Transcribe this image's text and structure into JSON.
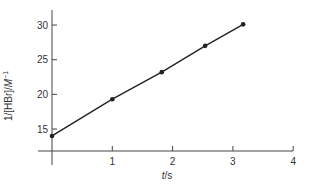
{
  "chart_data": {
    "type": "line",
    "title": "",
    "xlabel": "t/s",
    "xlabel_parts": {
      "var": "t",
      "unit": "/s"
    },
    "ylabel": "1/[HBr]/M⁻¹",
    "ylabel_parts": {
      "prefix": "1/[HBr]/",
      "var": "M",
      "sup": "−1"
    },
    "x": [
      0.0,
      1.0,
      1.82,
      2.54,
      3.17
    ],
    "series": [
      {
        "name": "1/[HBr]",
        "values": [
          14.0,
          19.3,
          23.2,
          27.0,
          30.1
        ],
        "markers": true,
        "color": "#222222"
      }
    ],
    "xlim": [
      0,
      4
    ],
    "ylim": [
      12,
      32
    ],
    "xticks": [
      1,
      2,
      3,
      4
    ],
    "xtick_labels": [
      "1",
      "2",
      "3",
      "4"
    ],
    "yticks": [
      15,
      20,
      25,
      30
    ],
    "ytick_labels": [
      "15",
      "20",
      "25",
      "30"
    ],
    "grid": false,
    "legend": null
  }
}
